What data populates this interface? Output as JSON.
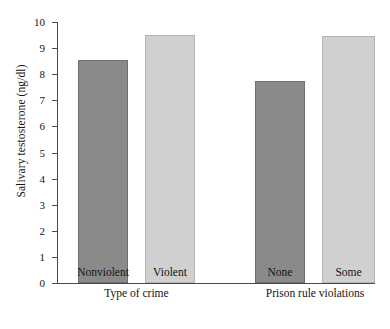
{
  "chart_data": {
    "type": "bar",
    "title": "",
    "xlabel": "",
    "ylabel": "Salivary testosterone (ng/dl)",
    "ylim": [
      0,
      10
    ],
    "ytick_labels": [
      "0",
      "1",
      "2",
      "3",
      "4",
      "5",
      "6",
      "7",
      "8",
      "9",
      "10"
    ],
    "ytick_values": [
      0,
      1,
      2,
      3,
      4,
      5,
      6,
      7,
      8,
      9,
      10
    ],
    "grid": false,
    "legend": "none",
    "categories": [
      "Nonviolent",
      "Violent",
      "None",
      "Some"
    ],
    "values": [
      8.55,
      9.5,
      7.75,
      9.45
    ],
    "groups": [
      {
        "label": "Type of crime",
        "categories": [
          "Nonviolent",
          "Violent"
        ],
        "values": [
          8.55,
          9.5
        ]
      },
      {
        "label": "Prison rule violations",
        "categories": [
          "None",
          "Some"
        ],
        "values": [
          7.75,
          9.45
        ]
      }
    ],
    "bars": [
      {
        "category": "Nonviolent",
        "value": 8.55,
        "shade": "dark",
        "group": "Type of crime"
      },
      {
        "category": "Violent",
        "value": 9.5,
        "shade": "light",
        "group": "Type of crime"
      },
      {
        "category": "None",
        "value": 7.75,
        "shade": "dark",
        "group": "Prison rule violations"
      },
      {
        "category": "Some",
        "value": 9.45,
        "shade": "light",
        "group": "Prison rule violations"
      }
    ],
    "colors": {
      "dark_bar": "#8a8a8a",
      "light_bar": "#d0d0d0",
      "axis": "#4a4a4a",
      "background": "#ffffff",
      "text": "#141414"
    }
  }
}
